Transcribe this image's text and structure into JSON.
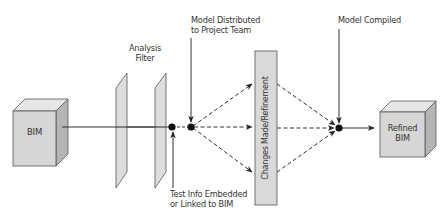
{
  "diagram": {
    "nodes": {
      "bim": {
        "label": "BIM"
      },
      "analysis_filter": {
        "label_line1": "Analysis",
        "label_line2": "Filter"
      },
      "changes": {
        "label": "Changes Made/Refinement"
      },
      "refined_bim": {
        "label_line1": "Refined",
        "label_line2": "BIM"
      }
    },
    "annotations": {
      "model_distributed": {
        "line1": "Model Distributed",
        "line2": "to Project Team"
      },
      "test_info": {
        "line1": "Test Info Embedded",
        "line2": "or Linked to BIM"
      },
      "model_compiled": {
        "label": "Model Compiled"
      }
    },
    "colors": {
      "box_fill": "#d9d9d9",
      "box_top": "#e8e8e8",
      "box_side": "#b8b8b8",
      "stroke": "#444444",
      "line": "#333333",
      "dot": "#111111"
    }
  }
}
